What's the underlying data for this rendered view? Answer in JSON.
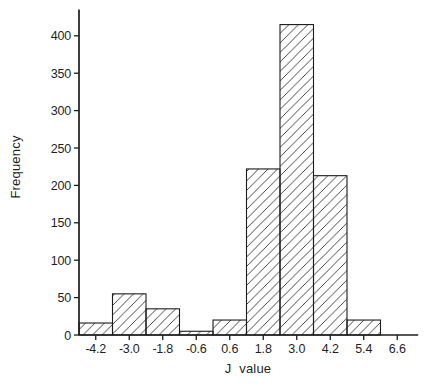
{
  "chart_data": {
    "type": "bar",
    "subtype": "histogram",
    "title": "",
    "xlabel": "J value",
    "ylabel": "Frequency",
    "bin_width": 1.2,
    "bin_centers": [
      -4.2,
      -3.0,
      -1.8,
      -0.6,
      0.6,
      1.8,
      3.0,
      4.2,
      5.4
    ],
    "values": [
      16,
      55,
      35,
      5,
      20,
      222,
      415,
      213,
      20
    ],
    "x_ticks": [
      -4.2,
      -3.0,
      -1.8,
      -0.6,
      0.6,
      1.8,
      3.0,
      4.2,
      5.4,
      6.6
    ],
    "x_tick_labels": [
      "-4.2",
      "-3.0",
      "-1.8",
      "-0.6",
      "0.6",
      "1.8",
      "3.0",
      "4.2",
      "5.4",
      "6.6"
    ],
    "y_ticks": [
      0,
      50,
      100,
      150,
      200,
      250,
      300,
      350,
      400
    ],
    "y_tick_labels": [
      "0",
      "50",
      "100",
      "150",
      "200",
      "250",
      "300",
      "350",
      "400"
    ],
    "xlim": [
      -4.8,
      7.35
    ],
    "ylim": [
      0,
      435
    ],
    "grid": false,
    "legend": false,
    "bar_style": {
      "fill": "diagonal-hatch",
      "hatch_angle_deg": 45,
      "hatch_spacing_px": 9.5,
      "line_color": "#1c1c1c",
      "background": "#ffffff"
    }
  }
}
